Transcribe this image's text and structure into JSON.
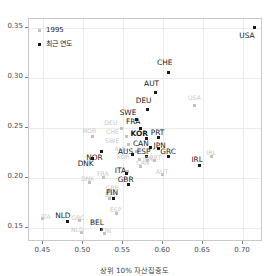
{
  "chart_data": {
    "type": "scatter",
    "title": "",
    "xlabel": "상위 10% 자산집중도",
    "ylabel": "상위 1% 자산집중도",
    "xlim": [
      0.432,
      0.725
    ],
    "ylim": [
      0.1355,
      0.3585
    ],
    "xticks": [
      0.45,
      0.5,
      0.55,
      0.6,
      0.65,
      0.7
    ],
    "xticklabels": [
      "0.45",
      "0.50",
      "0.55",
      "0.60",
      "0.65",
      "0.70"
    ],
    "yticks": [
      0.15,
      0.2,
      0.25,
      0.3,
      0.35
    ],
    "yticklabels": [
      "0.15",
      "0.20",
      "0.25",
      "0.30",
      "0.35"
    ],
    "grid": true,
    "legend_position": "top-left",
    "series": [
      {
        "name": "1995",
        "color": "#c2c2c2",
        "points": [
          {
            "label": "USA",
            "x": 0.639,
            "y": 0.272,
            "lx": 0.639,
            "ly": 0.28
          },
          {
            "label": "DEU",
            "x": 0.548,
            "y": 0.2493,
            "lx": 0.5345,
            "ly": 0.2548
          },
          {
            "label": "CHE",
            "x": 0.5545,
            "y": 0.2408,
            "lx": 0.5365,
            "ly": 0.2455
          },
          {
            "label": "SWE",
            "x": 0.556,
            "y": 0.233,
            "lx": 0.536,
            "ly": 0.2368
          },
          {
            "label": "AUS",
            "x": 0.5665,
            "y": 0.2258,
            "lx": 0.547,
            "ly": 0.2287
          },
          {
            "label": "KOR",
            "x": 0.5705,
            "y": 0.218,
            "lx": 0.55,
            "ly": 0.2205
          },
          {
            "label": "CAN",
            "x": 0.572,
            "y": 0.211,
            "lx": 0.5745,
            "ly": 0.2145
          },
          {
            "label": "NOR",
            "x": 0.5115,
            "y": 0.2415,
            "lx": 0.5075,
            "ly": 0.2468
          },
          {
            "label": "JPN",
            "x": 0.5805,
            "y": 0.2168,
            "lx": 0.581,
            "ly": 0.219
          },
          {
            "label": "PRT",
            "x": 0.5885,
            "y": 0.2172,
            "lx": 0.5905,
            "ly": 0.2192
          },
          {
            "label": "AUT",
            "x": 0.5985,
            "y": 0.2028,
            "lx": 0.5985,
            "ly": 0.206
          },
          {
            "label": "FRA",
            "x": 0.5255,
            "y": 0.1998,
            "lx": 0.5245,
            "ly": 0.2032
          },
          {
            "label": "DNK",
            "x": 0.508,
            "y": 0.1955,
            "lx": 0.5055,
            "ly": 0.1988
          },
          {
            "label": "GBR",
            "x": 0.5325,
            "y": 0.187,
            "lx": 0.536,
            "ly": 0.1895
          },
          {
            "label": "AUS2",
            "x": 0.5555,
            "y": 0.2062,
            "lx": 0.5425,
            "ly": 0.2078
          },
          {
            "label": "BEL",
            "x": 0.533,
            "y": 0.179,
            "lx": 0.5345,
            "ly": 0.1822
          },
          {
            "label": "ESP",
            "x": 0.541,
            "y": 0.1645,
            "lx": 0.5405,
            "ly": 0.1672
          },
          {
            "label": "GRC",
            "x": 0.495,
            "y": 0.1572,
            "lx": 0.493,
            "ly": 0.1598
          },
          {
            "label": "ITA",
            "x": 0.449,
            "y": 0.1588,
            "lx": 0.453,
            "ly": 0.161
          },
          {
            "label": "NLD",
            "x": 0.4975,
            "y": 0.1452,
            "lx": 0.4925,
            "ly": 0.148
          },
          {
            "label": "FIN",
            "x": 0.527,
            "y": 0.144,
            "lx": 0.5285,
            "ly": 0.147
          },
          {
            "label": "IRL",
            "x": 0.661,
            "y": 0.221,
            "lx": 0.66,
            "ly": 0.225
          }
        ]
      },
      {
        "name": "최근 연도",
        "color": "#1a1a1a",
        "points": [
          {
            "label": "USA",
            "x": 0.714,
            "y": 0.3505,
            "lx": 0.705,
            "ly": 0.3418
          },
          {
            "label": "CHE",
            "x": 0.606,
            "y": 0.3055,
            "lx": 0.602,
            "ly": 0.3145
          },
          {
            "label": "AUT",
            "x": 0.5905,
            "y": 0.2855,
            "lx": 0.5855,
            "ly": 0.294
          },
          {
            "label": "DEU",
            "x": 0.58,
            "y": 0.268,
            "lx": 0.5755,
            "ly": 0.2768
          },
          {
            "label": "SWE",
            "x": 0.5665,
            "y": 0.2585,
            "lx": 0.556,
            "ly": 0.2648
          },
          {
            "label": "FRA",
            "x": 0.5715,
            "y": 0.249,
            "lx": 0.5625,
            "ly": 0.2555
          },
          {
            "label": "KOR",
            "x": 0.579,
            "y": 0.239,
            "lx": 0.57,
            "ly": 0.2432
          },
          {
            "label": "PRT",
            "x": 0.594,
            "y": 0.24,
            "lx": 0.593,
            "ly": 0.2445
          },
          {
            "label": "CAN",
            "x": 0.5835,
            "y": 0.2298,
            "lx": 0.572,
            "ly": 0.234
          },
          {
            "label": "JPN",
            "x": 0.594,
            "y": 0.2292,
            "lx": 0.5955,
            "ly": 0.232
          },
          {
            "label": "ESP",
            "x": 0.579,
            "y": 0.2215,
            "lx": 0.5755,
            "ly": 0.2255
          },
          {
            "label": "AUS",
            "x": 0.5615,
            "y": 0.2228,
            "lx": 0.553,
            "ly": 0.2255
          },
          {
            "label": "GRC",
            "x": 0.607,
            "y": 0.2215,
            "lx": 0.606,
            "ly": 0.2258
          },
          {
            "label": "IRL",
            "x": 0.645,
            "y": 0.2118,
            "lx": 0.6425,
            "ly": 0.2178
          },
          {
            "label": "NOR",
            "x": 0.5225,
            "y": 0.2258,
            "lx": 0.514,
            "ly": 0.2198
          },
          {
            "label": "DNK",
            "x": 0.511,
            "y": 0.219,
            "lx": 0.503,
            "ly": 0.2132
          },
          {
            "label": "ITA",
            "x": 0.5545,
            "y": 0.2045,
            "lx": 0.5465,
            "ly": 0.207
          },
          {
            "label": "GBR",
            "x": 0.557,
            "y": 0.193,
            "lx": 0.553,
            "ly": 0.1978
          },
          {
            "label": "FIN",
            "x": 0.538,
            "y": 0.1795,
            "lx": 0.536,
            "ly": 0.1848
          },
          {
            "label": "NLD",
            "x": 0.48,
            "y": 0.1558,
            "lx": 0.4745,
            "ly": 0.1615
          },
          {
            "label": "BEL",
            "x": 0.5225,
            "y": 0.1485,
            "lx": 0.517,
            "ly": 0.1542
          }
        ]
      }
    ]
  },
  "legend": {
    "items": [
      {
        "label": "1995",
        "color": "#c2c2c2"
      },
      {
        "label": "최근 연도",
        "color": "#1a1a1a"
      }
    ]
  }
}
